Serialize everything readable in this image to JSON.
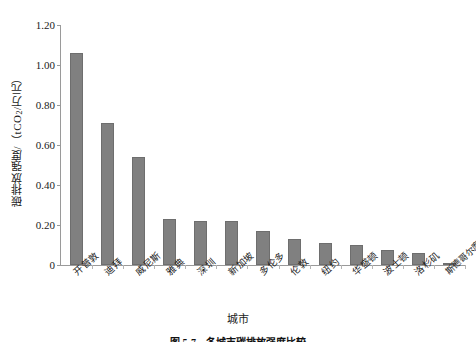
{
  "chart_data": {
    "type": "bar",
    "title": "",
    "xlabel": "城市",
    "ylabel": "碳排放强度/（tCO₂/万元）",
    "ylabel_prefix": "碳排放强度/（tCO",
    "ylabel_sub": "2",
    "ylabel_suffix": "/万元）",
    "categories": [
      "开普敦",
      "迪拜",
      "威尼斯",
      "雅典",
      "深圳",
      "新加坡",
      "多伦多",
      "伦敦",
      "纽约",
      "华盛顿",
      "波士顿",
      "洛杉矶",
      "斯德哥尔摩"
    ],
    "values": [
      1.06,
      0.71,
      0.54,
      0.23,
      0.22,
      0.22,
      0.17,
      0.13,
      0.11,
      0.1,
      0.075,
      0.06,
      0.005
    ],
    "ylim": [
      0,
      1.2
    ],
    "yticks": [
      0,
      0.2,
      0.4,
      0.6,
      0.8,
      1.0,
      1.2
    ],
    "ytick_labels": [
      "0",
      "0.20",
      "0.40",
      "0.60",
      "0.80",
      "1.00",
      "1.20"
    ],
    "grid": false,
    "legend": "none",
    "bar_color": "#808080",
    "bar_edge_color": "#6e6e6e",
    "axis_color": "#9a9a9a"
  },
  "caption": {
    "text": "图 5-7　各城市碳排放强度比较"
  }
}
